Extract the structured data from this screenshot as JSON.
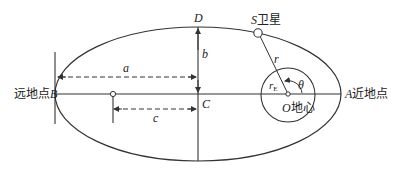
{
  "colors": {
    "stroke": "#333333",
    "background": "#ffffff"
  },
  "labels": {
    "apogee": "远地点",
    "apogee_point": "B",
    "perigee_point": "A",
    "perigee": "近地点",
    "D": "D",
    "C": "C",
    "satellite_point": "S",
    "satellite": "卫星",
    "earth_point": "O",
    "earth": "地心",
    "semi_major": "a",
    "semi_minor": "b",
    "focal": "c",
    "radius": "r",
    "earth_radius": "r",
    "earth_radius_sub": "E",
    "angle": "θ"
  },
  "geometry": {
    "ellipse": {
      "cx": 198,
      "cy": 94,
      "rx": 143,
      "ry": 67
    },
    "earth_center": {
      "x": 289,
      "y": 94
    },
    "earth_radius_px": 27,
    "satellite_pos": {
      "x": 260,
      "y": 32
    },
    "empty_focus": {
      "x": 112,
      "y": 94
    }
  }
}
